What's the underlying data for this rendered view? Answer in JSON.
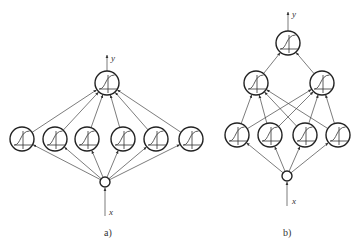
{
  "diagrams": [
    {
      "id": "a",
      "caption": "a)",
      "input_label": "x",
      "output_label": "y",
      "input": {
        "cx": 105,
        "cy": 182,
        "r": 5
      },
      "input_arrow": {
        "x": 105,
        "y1": 216,
        "y2": 188
      },
      "output_arrow": {
        "x": 107,
        "y1": 71,
        "y2": 55
      },
      "layers": [
        [
          {
            "cx": 22,
            "cy": 139
          },
          {
            "cx": 55,
            "cy": 139
          },
          {
            "cx": 87,
            "cy": 139
          },
          {
            "cx": 123,
            "cy": 139
          },
          {
            "cx": 156,
            "cy": 139
          },
          {
            "cx": 191,
            "cy": 139
          }
        ],
        [
          {
            "cx": 107,
            "cy": 83
          }
        ]
      ],
      "node_radius": 12,
      "caption_pos": {
        "x": 104,
        "y": 236
      },
      "x_label_pos": {
        "x": 109,
        "y": 215
      },
      "y_label_pos": {
        "x": 111,
        "y": 61
      }
    },
    {
      "id": "b",
      "caption": "b)",
      "input_label": "x",
      "output_label": "y",
      "input": {
        "cx": 287,
        "cy": 176,
        "r": 5
      },
      "input_arrow": {
        "x": 287,
        "y1": 206,
        "y2": 182
      },
      "output_arrow": {
        "x": 288,
        "y1": 31,
        "y2": 12
      },
      "layers": [
        [
          {
            "cx": 237,
            "cy": 135
          },
          {
            "cx": 270,
            "cy": 135
          },
          {
            "cx": 305,
            "cy": 135
          },
          {
            "cx": 338,
            "cy": 135
          }
        ],
        [
          {
            "cx": 256,
            "cy": 83
          },
          {
            "cx": 322,
            "cy": 83
          }
        ],
        [
          {
            "cx": 288,
            "cy": 43
          }
        ]
      ],
      "node_radius": 12,
      "caption_pos": {
        "x": 283,
        "y": 236
      },
      "x_label_pos": {
        "x": 292,
        "y": 204
      },
      "y_label_pos": {
        "x": 292,
        "y": 17
      }
    }
  ],
  "node_type": "sigmoid-neuron",
  "colors": {
    "stroke": "#222222",
    "edge": "#444444",
    "background": "#ffffff"
  }
}
